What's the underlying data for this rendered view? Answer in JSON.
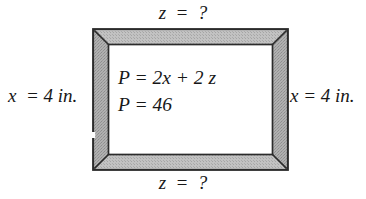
{
  "figure": {
    "background_color": "#ffffff",
    "ink_color": "#171717"
  },
  "frame": {
    "name": "picture-frame",
    "band_color": "#a8a8a8",
    "band_highlight_color": "#c4c4c4",
    "outline_color": "#2b2b2b",
    "interior_color": "#ffffff",
    "band_thickness_px": 14,
    "outer": {
      "x": 92,
      "y": 28,
      "width": 197,
      "height": 143
    }
  },
  "labels": {
    "top": "z  =  ?",
    "bottom": "z  =  ?",
    "left": "x  = 4 in.",
    "right": "x = 4 in."
  },
  "formulas": {
    "line1": "P = 2x + 2 z",
    "line2": "P = 46"
  },
  "values": {
    "x": "4 in.",
    "z": "?",
    "P": "46",
    "perimeter_equation": "P = 2x + 2z"
  }
}
